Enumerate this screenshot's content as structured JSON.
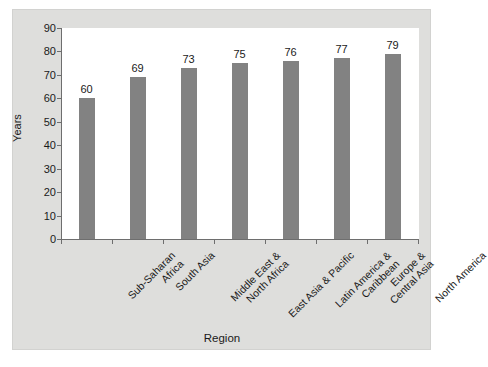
{
  "chart_data": {
    "type": "bar",
    "title": "",
    "xlabel": "Region",
    "ylabel": "Years",
    "ylim": [
      0,
      90
    ],
    "ytick_step": 10,
    "yticks": [
      "90",
      "80",
      "70",
      "60",
      "50",
      "40",
      "30",
      "20",
      "10",
      "0"
    ],
    "grid": false,
    "legend": null,
    "bar_color": "#828282",
    "panel_color": "#dededc",
    "plot_bg": "#ffffff",
    "categories": [
      "Sub-Saharan Africa",
      "South Asia",
      "Middle East & North Africa",
      "East Asia & Pacific",
      "Latin America & Caribbean",
      "Europe & Central Asia",
      "North America"
    ],
    "category_lines": [
      [
        "Sub-Saharan",
        "Africa"
      ],
      [
        "South Asia"
      ],
      [
        "Middle East &",
        "North Africa"
      ],
      [
        "East Asia & Pacific"
      ],
      [
        "Latin America &",
        "Caribbean"
      ],
      [
        "Europe &",
        "Central Asia"
      ],
      [
        "North America"
      ]
    ],
    "values": [
      60,
      69,
      73,
      75,
      76,
      77,
      79
    ],
    "value_labels": [
      "60",
      "69",
      "73",
      "75",
      "76",
      "77",
      "79"
    ]
  }
}
